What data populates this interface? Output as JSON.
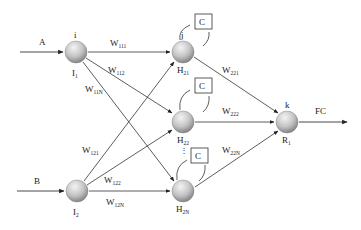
{
  "colors": {
    "line": "#333333",
    "node_light": "#eeeeee",
    "node_dark": "#8a8a8a",
    "text": "#222222"
  },
  "inputs": [
    {
      "id": "A",
      "label": "A",
      "node": "I1"
    },
    {
      "id": "B",
      "label": "B",
      "node": "I2"
    }
  ],
  "nodes": {
    "I1": {
      "top_label": "i",
      "bottom_label": "I",
      "bottom_sub": "1"
    },
    "I2": {
      "bottom_label": "I",
      "bottom_sub": "2"
    },
    "H21": {
      "top_label": "j",
      "bottom_label": "H",
      "bottom_sub": "21",
      "context": "C"
    },
    "H22": {
      "bottom_label": "H",
      "bottom_sub": "22",
      "context": "C"
    },
    "H2N": {
      "bottom_label": "H",
      "bottom_sub": "2N",
      "context": "C"
    },
    "R1": {
      "top_label": "k",
      "bottom_label": "R",
      "bottom_sub": "1"
    }
  },
  "weights": {
    "w111": {
      "base": "W",
      "sub": "111"
    },
    "w112": {
      "base": "W",
      "sub": "112"
    },
    "w11N": {
      "base": "W",
      "sub": "11N"
    },
    "w121": {
      "base": "W",
      "sub": "121"
    },
    "w122": {
      "base": "W",
      "sub": "122"
    },
    "w12N": {
      "base": "W",
      "sub": "12N"
    },
    "w221": {
      "base": "W",
      "sub": "221"
    },
    "w222": {
      "base": "W",
      "sub": "222"
    },
    "w22N": {
      "base": "W",
      "sub": "22N"
    }
  },
  "output": {
    "label": "FC"
  },
  "ellipsis": "⋮"
}
